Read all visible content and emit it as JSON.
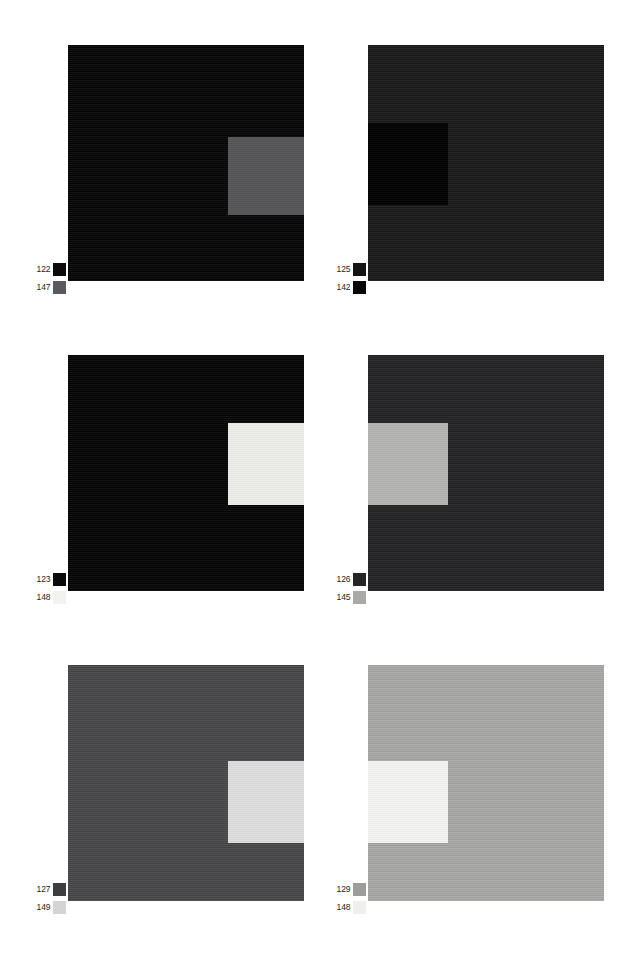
{
  "figure": {
    "background_color": "#ffffff",
    "width": 622,
    "height": 971,
    "layout": {
      "columns": 2,
      "rows": 3,
      "panel_count": 6
    }
  },
  "panels": [
    {
      "id": "panel-1",
      "position": {
        "x": 68,
        "y": 45,
        "size": 236
      },
      "background_color": "#060606",
      "inset": {
        "x": 160,
        "y": 92,
        "width": 76,
        "height": 78,
        "color": "#56565a"
      },
      "legend": {
        "x": 34,
        "y": 262,
        "entries": [
          {
            "label": "122",
            "swatch_color": "#0b0b0b"
          },
          {
            "label": "147",
            "swatch_color": "#5a5a5e"
          }
        ]
      }
    },
    {
      "id": "panel-2",
      "position": {
        "x": 368,
        "y": 45,
        "size": 236
      },
      "background_color": "#1b1a1b",
      "inset": {
        "x": 0,
        "y": 78,
        "width": 80,
        "height": 82,
        "color": "#030303"
      },
      "legend": {
        "x": 334,
        "y": 262,
        "entries": [
          {
            "label": "125",
            "swatch_color": "#151415"
          },
          {
            "label": "142",
            "swatch_color": "#050505"
          }
        ]
      }
    },
    {
      "id": "panel-3",
      "position": {
        "x": 68,
        "y": 355,
        "size": 236
      },
      "background_color": "#050505",
      "inset": {
        "x": 160,
        "y": 68,
        "width": 76,
        "height": 82,
        "color": "#eeeeea"
      },
      "legend": {
        "x": 34,
        "y": 572,
        "entries": [
          {
            "label": "123",
            "swatch_color": "#0a0a0a"
          },
          {
            "label": "148",
            "swatch_color": "#f2f2f0"
          }
        ]
      }
    },
    {
      "id": "panel-4",
      "position": {
        "x": 368,
        "y": 355,
        "size": 236
      },
      "background_color": "#232224",
      "inset": {
        "x": 0,
        "y": 68,
        "width": 80,
        "height": 82,
        "color": "#b5b5b3"
      },
      "legend": {
        "x": 334,
        "y": 572,
        "entries": [
          {
            "label": "126",
            "swatch_color": "#252426"
          },
          {
            "label": "145",
            "swatch_color": "#a9a9a7"
          }
        ]
      }
    },
    {
      "id": "panel-5",
      "position": {
        "x": 68,
        "y": 665,
        "size": 236
      },
      "background_color": "#484749",
      "inset": {
        "x": 160,
        "y": 96,
        "width": 76,
        "height": 82,
        "color": "#dedede"
      },
      "legend": {
        "x": 34,
        "y": 882,
        "entries": [
          {
            "label": "127",
            "swatch_color": "#3e3d3f"
          },
          {
            "label": "149",
            "swatch_color": "#d4d4d4"
          }
        ]
      }
    },
    {
      "id": "panel-6",
      "position": {
        "x": 368,
        "y": 665,
        "size": 236
      },
      "background_color": "#a9a9a7",
      "inset": {
        "x": 0,
        "y": 96,
        "width": 80,
        "height": 82,
        "color": "#f4f4f2"
      },
      "legend": {
        "x": 334,
        "y": 882,
        "entries": [
          {
            "label": "129",
            "swatch_color": "#9d9d9b"
          },
          {
            "label": "148",
            "swatch_color": "#efefed"
          }
        ]
      }
    }
  ],
  "chart_data": {
    "type": "heatmap",
    "title": "",
    "xlabel": "",
    "ylabel": "",
    "grid": false,
    "legend_position": "below-left",
    "panels": [
      {
        "panel": 1,
        "background_gray": 6,
        "inset_gray": 86,
        "labels": [
          122,
          147
        ],
        "inset_side": "right"
      },
      {
        "panel": 2,
        "background_gray": 27,
        "inset_gray": 3,
        "labels": [
          125,
          142
        ],
        "inset_side": "left"
      },
      {
        "panel": 3,
        "background_gray": 5,
        "inset_gray": 238,
        "labels": [
          123,
          148
        ],
        "inset_side": "right"
      },
      {
        "panel": 4,
        "background_gray": 35,
        "inset_gray": 181,
        "labels": [
          126,
          145
        ],
        "inset_side": "left"
      },
      {
        "panel": 5,
        "background_gray": 72,
        "inset_gray": 222,
        "labels": [
          127,
          149
        ],
        "inset_side": "right"
      },
      {
        "panel": 6,
        "background_gray": 169,
        "inset_gray": 244,
        "labels": [
          129,
          148
        ],
        "inset_side": "left"
      }
    ],
    "series": [
      {
        "name": "background gray level",
        "values": [
          6,
          27,
          5,
          35,
          72,
          169
        ]
      },
      {
        "name": "inset gray level",
        "values": [
          86,
          3,
          238,
          181,
          222,
          244
        ]
      }
    ],
    "categories": [
      "1",
      "2",
      "3",
      "4",
      "5",
      "6"
    ],
    "ylim": [
      0,
      255
    ]
  }
}
